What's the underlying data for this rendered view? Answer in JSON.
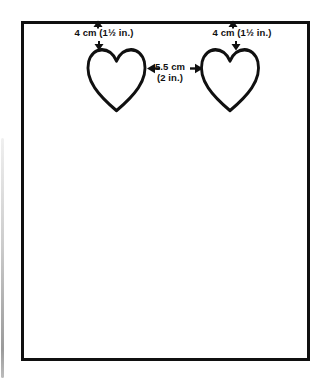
{
  "diagram": {
    "kind": "craft-template-measurement-diagram",
    "annotations": {
      "left_height": "4 cm (1½ in.)",
      "right_height": "4 cm (1½ in.)",
      "gap_line1": "5.5 cm",
      "gap_line2": "(2 in.)"
    },
    "shapes": {
      "card": "rectangle-outline",
      "motifs": [
        "heart-outline",
        "heart-outline"
      ]
    },
    "icons": [
      "arrow-up-icon",
      "arrow-down-icon",
      "arrow-left-icon",
      "arrow-right-icon"
    ],
    "colors": {
      "ink": "#101010",
      "paper": "#ffffff",
      "scan_edge_shadow": "#8f8f8f"
    }
  }
}
